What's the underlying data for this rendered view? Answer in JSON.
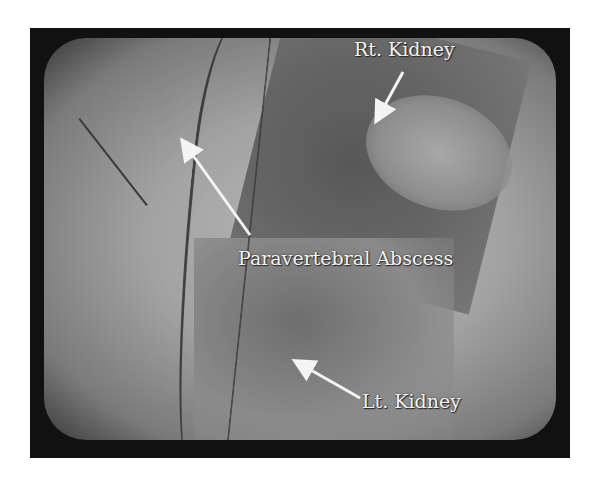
{
  "image": {
    "description": "Ultrasound monitor photograph with annotated anatomy",
    "background": "#ffffff",
    "screen_color": "#a6a6a6"
  },
  "labels": {
    "rt_kidney": "Rt. Kidney",
    "paravertebral_abscess": "Paravertebral Abscess",
    "lt_kidney": "Lt. Kidney"
  },
  "arrows": [
    {
      "name": "rt-kidney-arrow",
      "from": [
        403,
        72
      ],
      "to": [
        378,
        118
      ]
    },
    {
      "name": "abscess-arrow",
      "from": [
        250,
        235
      ],
      "to": [
        184,
        142
      ]
    },
    {
      "name": "lt-kidney-arrow",
      "from": [
        360,
        398
      ],
      "to": [
        298,
        362
      ]
    }
  ]
}
